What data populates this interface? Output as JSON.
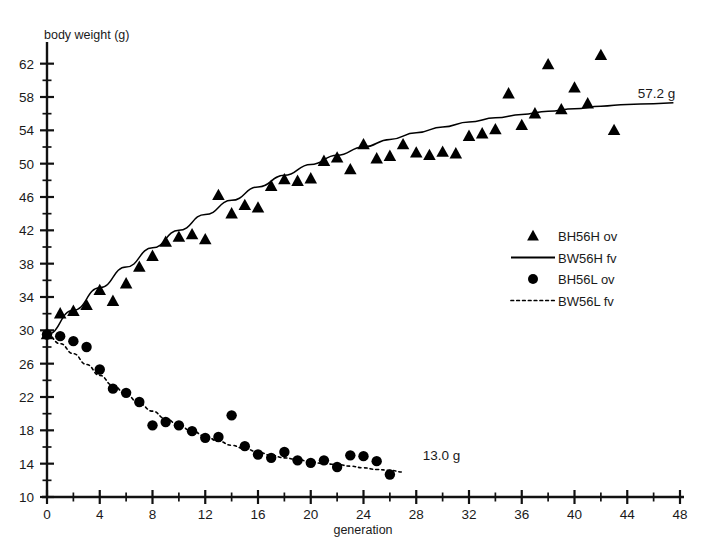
{
  "chart_data": {
    "type": "scatter",
    "title": "",
    "xlabel": "generation",
    "ylabel": "body weight (g)",
    "xlim": [
      0,
      48
    ],
    "ylim": [
      10,
      64
    ],
    "xticks": [
      0,
      4,
      8,
      12,
      16,
      20,
      24,
      28,
      32,
      36,
      40,
      44,
      48
    ],
    "yticks": [
      10,
      14,
      18,
      22,
      26,
      30,
      34,
      38,
      42,
      46,
      50,
      54,
      58,
      62
    ],
    "xminor_step": 2,
    "yminor_step": 2,
    "grid": false,
    "legend_position": "right-middle",
    "series": [
      {
        "name": "BH56H ov",
        "marker": "triangle",
        "color": "#000000",
        "points": [
          [
            0,
            29.5
          ],
          [
            1,
            32.0
          ],
          [
            2,
            32.3
          ],
          [
            3,
            33.0
          ],
          [
            4,
            34.8
          ],
          [
            5,
            33.5
          ],
          [
            6,
            35.6
          ],
          [
            7,
            37.6
          ],
          [
            8,
            38.9
          ],
          [
            9,
            40.6
          ],
          [
            10,
            41.2
          ],
          [
            11,
            41.5
          ],
          [
            12,
            40.9
          ],
          [
            13,
            46.2
          ],
          [
            14,
            44.0
          ],
          [
            15,
            45.0
          ],
          [
            16,
            44.7
          ],
          [
            17,
            47.3
          ],
          [
            18,
            48.1
          ],
          [
            19,
            47.9
          ],
          [
            20,
            48.2
          ],
          [
            21,
            50.3
          ],
          [
            22,
            50.7
          ],
          [
            23,
            49.3
          ],
          [
            24,
            52.3
          ],
          [
            25,
            50.6
          ],
          [
            26,
            50.9
          ],
          [
            27,
            52.3
          ],
          [
            28,
            51.3
          ],
          [
            29,
            51.0
          ],
          [
            30,
            51.4
          ],
          [
            31,
            51.2
          ],
          [
            32,
            53.3
          ],
          [
            33,
            53.6
          ],
          [
            34,
            54.1
          ],
          [
            35,
            58.4
          ],
          [
            36,
            54.6
          ],
          [
            37,
            56.0
          ],
          [
            38,
            61.9
          ],
          [
            39,
            56.5
          ],
          [
            40,
            59.1
          ],
          [
            41,
            57.2
          ],
          [
            42,
            63.0
          ],
          [
            43,
            54.0
          ]
        ]
      },
      {
        "name": "BW56H fv",
        "marker": "line",
        "linestyle": "solid",
        "color": "#000000",
        "fit": "rising-saturating curve from 29.5 g at generation 0 to 57.2 g at generation 48",
        "points": [
          [
            0,
            29.5
          ],
          [
            2,
            32.4
          ],
          [
            4,
            35.1
          ],
          [
            6,
            37.6
          ],
          [
            8,
            39.9
          ],
          [
            10,
            42.0
          ],
          [
            12,
            43.9
          ],
          [
            14,
            45.6
          ],
          [
            16,
            47.2
          ],
          [
            18,
            48.6
          ],
          [
            20,
            49.9
          ],
          [
            22,
            51.0
          ],
          [
            24,
            52.0
          ],
          [
            26,
            52.9
          ],
          [
            28,
            53.7
          ],
          [
            30,
            54.4
          ],
          [
            32,
            55.0
          ],
          [
            34,
            55.5
          ],
          [
            36,
            55.9
          ],
          [
            38,
            56.3
          ],
          [
            40,
            56.6
          ],
          [
            42,
            56.9
          ],
          [
            44,
            57.1
          ],
          [
            46,
            57.2
          ],
          [
            47.5,
            57.3
          ]
        ]
      },
      {
        "name": "BH56L ov",
        "marker": "circle",
        "color": "#000000",
        "points": [
          [
            0,
            29.5
          ],
          [
            1,
            29.3
          ],
          [
            2,
            28.7
          ],
          [
            3,
            28.0
          ],
          [
            4,
            25.3
          ],
          [
            5,
            23.0
          ],
          [
            6,
            22.5
          ],
          [
            7,
            21.4
          ],
          [
            8,
            18.6
          ],
          [
            9,
            19.0
          ],
          [
            10,
            18.6
          ],
          [
            11,
            17.9
          ],
          [
            12,
            17.1
          ],
          [
            13,
            17.2
          ],
          [
            14,
            19.8
          ],
          [
            15,
            16.1
          ],
          [
            16,
            15.1
          ],
          [
            17,
            14.7
          ],
          [
            18,
            15.4
          ],
          [
            19,
            14.4
          ],
          [
            20,
            14.1
          ],
          [
            21,
            14.4
          ],
          [
            22,
            13.6
          ],
          [
            23,
            15.0
          ],
          [
            24,
            14.9
          ],
          [
            25,
            14.3
          ],
          [
            26,
            12.7
          ]
        ]
      },
      {
        "name": "BW56L fv",
        "marker": "line",
        "linestyle": "dotted",
        "color": "#000000",
        "fit": "declining decaying curve from 29.5 g at generation 0 to 13.0 g at generation 27",
        "points": [
          [
            0,
            29.5
          ],
          [
            1,
            28.4
          ],
          [
            2,
            27.2
          ],
          [
            3,
            25.9
          ],
          [
            4,
            24.6
          ],
          [
            5,
            23.4
          ],
          [
            6,
            22.3
          ],
          [
            7,
            21.2
          ],
          [
            8,
            20.3
          ],
          [
            9,
            19.4
          ],
          [
            10,
            18.6
          ],
          [
            11,
            17.9
          ],
          [
            12,
            17.3
          ],
          [
            13,
            16.7
          ],
          [
            14,
            16.2
          ],
          [
            15,
            15.8
          ],
          [
            16,
            15.4
          ],
          [
            17,
            15.0
          ],
          [
            18,
            14.7
          ],
          [
            19,
            14.5
          ],
          [
            20,
            14.2
          ],
          [
            21,
            14.0
          ],
          [
            22,
            13.9
          ],
          [
            23,
            13.7
          ],
          [
            24,
            13.5
          ],
          [
            25,
            13.3
          ],
          [
            26,
            13.2
          ],
          [
            27,
            13.0
          ]
        ]
      }
    ],
    "annotations": [
      {
        "text": "57.2 g",
        "x": 44.8,
        "y": 57.9,
        "series": "BW56H fv"
      },
      {
        "text": "13.0 g",
        "x": 28.5,
        "y": 14.4,
        "series": "BW56L fv"
      }
    ]
  },
  "legend": {
    "entries": [
      {
        "label": "BH56H ov",
        "symbol": "triangle"
      },
      {
        "label": "BW56H fv",
        "symbol": "solid-line"
      },
      {
        "label": "BH56L ov",
        "symbol": "circle"
      },
      {
        "label": "BW56L fv",
        "symbol": "dotted-line"
      }
    ]
  }
}
